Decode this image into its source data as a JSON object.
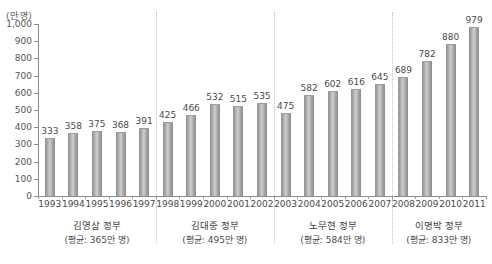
{
  "chart_data": {
    "type": "bar",
    "title": "",
    "subtitle": "",
    "xlabel": "",
    "ylabel": "",
    "unit_label": "(만 명)",
    "ylim": [
      0,
      1000
    ],
    "grid": false,
    "legend": "none",
    "categories": [
      "1993",
      "1994",
      "1995",
      "1996",
      "1997",
      "1998",
      "1999",
      "2000",
      "2001",
      "2002",
      "2003",
      "2004",
      "2005",
      "2006",
      "2007",
      "2008",
      "2009",
      "2010",
      "2011"
    ],
    "values": [
      333,
      358,
      375,
      368,
      391,
      425,
      466,
      532,
      515,
      535,
      475,
      582,
      602,
      616,
      645,
      689,
      782,
      880,
      979
    ],
    "ytick_labels": [
      "1,000",
      "900",
      "800",
      "700",
      "600",
      "500",
      "400",
      "300",
      "200",
      "100",
      "0"
    ],
    "ytick_values": [
      1000,
      900,
      800,
      700,
      600,
      500,
      400,
      300,
      200,
      100,
      0
    ],
    "annotations": [
      {
        "name": "김영삼 정부",
        "avg_text": "(평균: 365만 명)",
        "start": "1993",
        "end": "1997",
        "avg": 365
      },
      {
        "name": "김대중 정부",
        "avg_text": "(평균: 495만 명)",
        "start": "1998",
        "end": "2002",
        "avg": 495
      },
      {
        "name": "노무현 정부",
        "avg_text": "(평균: 584만 명)",
        "start": "2003",
        "end": "2007",
        "avg": 584
      },
      {
        "name": "이명박 정부",
        "avg_text": "(평균: 833만 명)",
        "start": "2008",
        "end": "2011",
        "avg": 833
      }
    ],
    "divider_after_index": [
      4,
      9,
      14
    ]
  },
  "colors": {
    "bar": "#a8a8a8",
    "axis": "#8c8c8c",
    "text": "#4a4a4a",
    "divider": "#c2c2c2",
    "background": "#ffffff"
  }
}
